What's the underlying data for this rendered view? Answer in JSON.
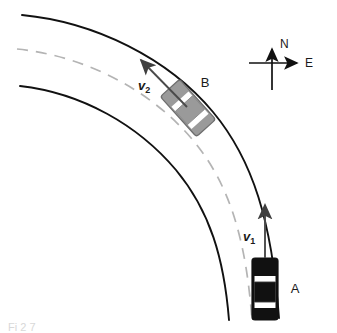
{
  "figure": {
    "type": "physics-diagram",
    "background_color": "#ffffff"
  },
  "road": {
    "outer_edge_name": "outer-road-edge",
    "inner_edge_name": "inner-road-edge",
    "center_line_name": "road-center-line",
    "edge_color": "#111111",
    "center_line_color": "#b4b4b4",
    "center_line_style": "dashed"
  },
  "cars": [
    {
      "id": "A",
      "label": "A",
      "color": "#111111",
      "stripe_color": "#ffffff",
      "rotation_deg": 0,
      "heading": "north",
      "position": {
        "x": 265,
        "y": 289
      }
    },
    {
      "id": "B",
      "label": "B",
      "color": "#9a9a9a",
      "stripe_color": "#ffffff",
      "rotation_deg": -42,
      "heading": "northwest",
      "position": {
        "x": 188,
        "y": 108
      }
    }
  ],
  "vectors": [
    {
      "id": "v1",
      "symbol": "v",
      "subscript": "1",
      "label_position": {
        "x": 248,
        "y": 236
      },
      "from": {
        "x": 265,
        "y": 258
      },
      "to": {
        "x": 265,
        "y": 202
      },
      "color": "#4a4a4a"
    },
    {
      "id": "v2",
      "symbol": "v",
      "subscript": "2",
      "label_position": {
        "x": 142,
        "y": 86
      },
      "from": {
        "x": 184,
        "y": 104
      },
      "to": {
        "x": 138,
        "y": 57
      },
      "color": "#4a4a4a"
    }
  ],
  "compass": {
    "name": "compass-rose",
    "north_label": "N",
    "east_label": "E",
    "center": {
      "x": 272,
      "y": 63
    },
    "color": "#111111"
  },
  "caption": {
    "text": "Figure 3.7",
    "visible_fragment": "Fi       2 7"
  }
}
